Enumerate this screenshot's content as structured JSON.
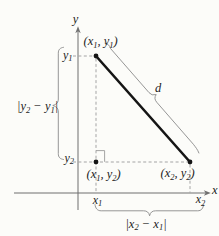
{
  "figure": {
    "colors": {
      "ink": "#1d1d1d",
      "axis": "#6f6f6f",
      "dash": "#9b9b9b",
      "brace": "#8a8a8a",
      "segment": "#151515",
      "background": "#fcfcf9"
    },
    "axis_labels": {
      "y": "y",
      "x": "x"
    },
    "ticks": {
      "y1": {
        "base": "y",
        "sub": "1"
      },
      "y2": {
        "base": "y",
        "sub": "2"
      },
      "x1": {
        "base": "x",
        "sub": "1"
      },
      "x2": {
        "base": "x",
        "sub": "2"
      }
    },
    "point_labels": {
      "p1": {
        "open": "(x",
        "sub1": "1",
        "mid": ", y",
        "sub2": "1",
        "close": ")"
      },
      "p12": {
        "open": "(x",
        "sub1": "1",
        "mid": ", y",
        "sub2": "2",
        "close": ")"
      },
      "p2": {
        "open": "(x",
        "sub1": "2",
        "mid": ", y",
        "sub2": "2",
        "close": ")"
      }
    },
    "distance_labels": {
      "d": "d",
      "vertical": {
        "open": "|y",
        "sub1": "2",
        "mid": " − y",
        "sub2": "1",
        "close": "|"
      },
      "horizontal": {
        "open": "|x",
        "sub1": "2",
        "mid": " − x",
        "sub2": "1",
        "close": "|"
      }
    }
  }
}
